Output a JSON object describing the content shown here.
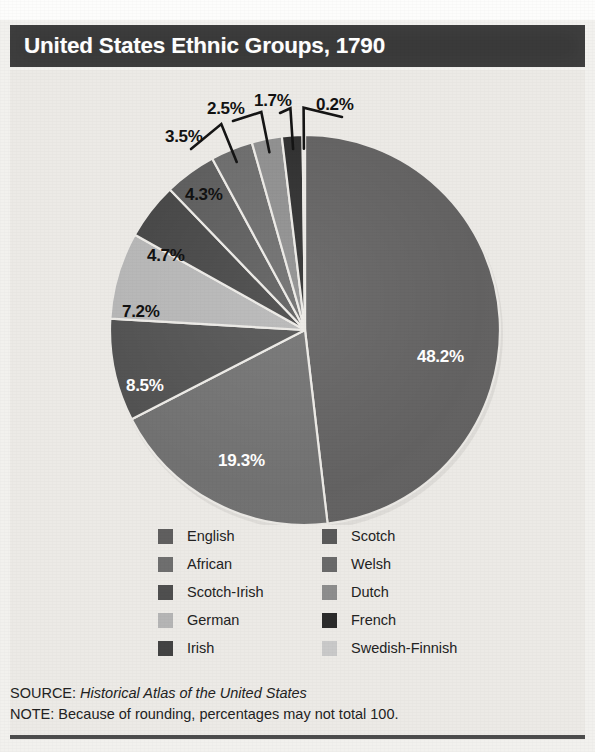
{
  "title": "United States Ethnic Groups, 1790",
  "footer": {
    "source_prefix": "SOURCE:",
    "source_title": "Historical Atlas of the United States",
    "note": "NOTE: Because of rounding, percentages may not total 100."
  },
  "legend": {
    "left": [
      {
        "label": "English",
        "color": "#605f5f"
      },
      {
        "label": "African",
        "color": "#6f6f6f"
      },
      {
        "label": "Scotch-Irish",
        "color": "#4f4f4f"
      },
      {
        "label": "German",
        "color": "#b5b5b5"
      },
      {
        "label": "Irish",
        "color": "#434343"
      }
    ],
    "right": [
      {
        "label": "Scotch",
        "color": "#5a5a5a"
      },
      {
        "label": "Welsh",
        "color": "#6a6a6a"
      },
      {
        "label": "Dutch",
        "color": "#8d8d8d"
      },
      {
        "label": "French",
        "color": "#2b2b2b"
      },
      {
        "label": "Swedish-Finnish",
        "color": "#c9c9c9"
      }
    ]
  },
  "chart_data": {
    "type": "pie",
    "title": "United States Ethnic Groups, 1790",
    "unit": "percent",
    "total_label": "100",
    "legend_position": "bottom",
    "grid": false,
    "categories": [
      "English",
      "African",
      "Scotch-Irish",
      "German",
      "Irish",
      "Scotch",
      "Welsh",
      "Dutch",
      "French",
      "Swedish-Finnish"
    ],
    "values": [
      48.2,
      19.3,
      8.5,
      7.2,
      4.7,
      4.3,
      3.5,
      2.5,
      1.7,
      0.2
    ],
    "labels": [
      "48.2%",
      "19.3%",
      "8.5%",
      "7.2%",
      "4.7%",
      "4.3%",
      "3.5%",
      "2.5%",
      "1.7%",
      "0.2%"
    ],
    "colors": [
      "#605f5f",
      "#6f6f6f",
      "#4f4f4f",
      "#b5b5b5",
      "#434343",
      "#5a5a5a",
      "#6a6a6a",
      "#8d8d8d",
      "#2b2b2b",
      "#c9c9c9"
    ],
    "slices": [
      {
        "name": "English",
        "value": 48.2,
        "label": "48.2%",
        "color": "#605f5f",
        "label_color": "light",
        "label_x": 407,
        "label_y": 277,
        "leader": false
      },
      {
        "name": "African",
        "value": 19.3,
        "label": "19.3%",
        "color": "#6f6f6f",
        "label_color": "light",
        "label_x": 208,
        "label_y": 381,
        "leader": false
      },
      {
        "name": "Scotch-Irish",
        "value": 8.5,
        "label": "8.5%",
        "color": "#4f4f4f",
        "label_color": "light",
        "label_x": 116,
        "label_y": 306,
        "leader": false
      },
      {
        "name": "German",
        "value": 7.2,
        "label": "7.2%",
        "color": "#b5b5b5",
        "label_color": "dark",
        "label_x": 112,
        "label_y": 232,
        "leader": false
      },
      {
        "name": "Irish",
        "value": 4.7,
        "label": "4.7%",
        "color": "#434343",
        "label_color": "dark",
        "label_x": 137,
        "label_y": 176,
        "leader": false
      },
      {
        "name": "Scotch",
        "value": 4.3,
        "label": "4.3%",
        "color": "#5a5a5a",
        "label_color": "dark",
        "label_x": 175,
        "label_y": 115,
        "leader": false
      },
      {
        "name": "Welsh",
        "value": 3.5,
        "label": "3.5%",
        "color": "#6a6a6a",
        "label_color": "dark",
        "label_x": 155,
        "label_y": 57,
        "leader": true
      },
      {
        "name": "Dutch",
        "value": 2.5,
        "label": "2.5%",
        "color": "#8d8d8d",
        "label_color": "dark",
        "label_x": 197,
        "label_y": 29,
        "leader": true
      },
      {
        "name": "French",
        "value": 1.7,
        "label": "1.7%",
        "color": "#2b2b2b",
        "label_color": "dark",
        "label_x": 244,
        "label_y": 21,
        "leader": true
      },
      {
        "name": "Swedish-Finnish",
        "value": 0.2,
        "label": "0.2%",
        "color": "#c9c9c9",
        "label_color": "dark",
        "label_x": 306,
        "label_y": 25,
        "leader": true
      }
    ]
  }
}
